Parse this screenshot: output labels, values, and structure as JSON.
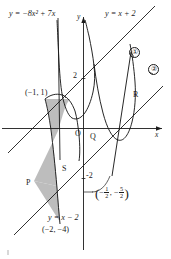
{
  "figure": {
    "title_note": "coordinate-geometry figure with two parabolas, two parallel lines and a shaded region",
    "axes": {
      "x_label": "x",
      "y_label": "y",
      "ticks": [
        {
          "label": "2",
          "axis": "y",
          "value": 2
        },
        {
          "label": "-2",
          "axis": "y",
          "value": -2
        }
      ]
    },
    "equations": {
      "parabola_left": "y = −8x² + 7x",
      "line_upper": "y = x + 2",
      "line_lower": "y = x − 2"
    },
    "curve_tags": [
      {
        "label": "①",
        "name": "curve-tag-1"
      },
      {
        "label": "②",
        "name": "curve-tag-2"
      }
    ],
    "points": [
      {
        "label": "O",
        "name": "point-O"
      },
      {
        "label": "Q",
        "name": "point-Q"
      },
      {
        "label": "R",
        "name": "point-R"
      },
      {
        "label": "P",
        "name": "point-P"
      },
      {
        "label": "S",
        "name": "point-S"
      }
    ],
    "coordinate_labels": [
      {
        "label": "(−1,  1)",
        "name": "coord-label-minus1-1"
      },
      {
        "label": "(−2, −4)",
        "name": "coord-label-minus2-minus4"
      }
    ],
    "fraction_label": {
      "open_paren": "(",
      "minus_1": "−",
      "num_1": "1",
      "den_1": "2",
      "comma": ",",
      "minus_2": "−",
      "num_2": "5",
      "den_2": "2",
      "close_paren": ")"
    },
    "colors": {
      "ink": "#1b1b1b",
      "shade_fill": "#b9b9b9",
      "background": "#ffffff"
    }
  }
}
